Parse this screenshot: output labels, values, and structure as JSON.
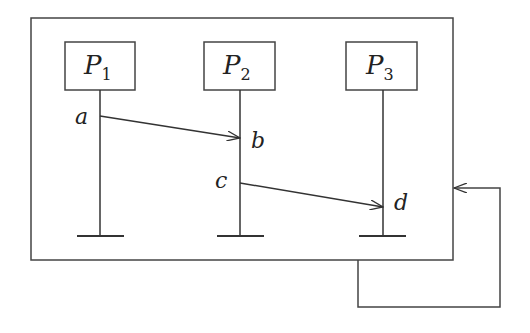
{
  "diagram": {
    "type": "space-time (message sequence) diagram",
    "processes": [
      {
        "name": "P",
        "index": "1"
      },
      {
        "name": "P",
        "index": "2"
      },
      {
        "name": "P",
        "index": "3"
      }
    ],
    "events": [
      {
        "label": "a",
        "process": "P1"
      },
      {
        "label": "b",
        "process": "P2"
      },
      {
        "label": "c",
        "process": "P2"
      },
      {
        "label": "d",
        "process": "P3"
      }
    ],
    "messages": [
      {
        "from": "a",
        "to": "b"
      },
      {
        "from": "c",
        "to": "d"
      }
    ],
    "feedback": {
      "description": "loop arrow from bottom of enclosing box back into its right side"
    },
    "colors": {
      "stroke": "#333333",
      "background": "#ffffff"
    }
  }
}
